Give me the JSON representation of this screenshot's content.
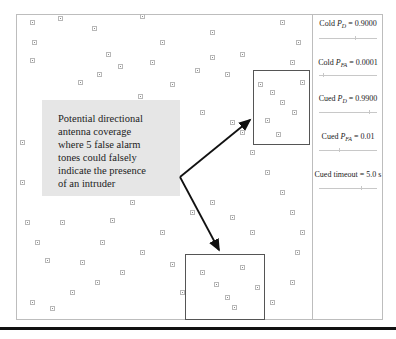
{
  "diagram": {
    "callout": {
      "lines": [
        "Potential directional",
        "antenna coverage",
        "where 5 false alarm",
        "tones could falsely",
        "indicate the presence",
        "of an intruder"
      ]
    },
    "zones": [
      {
        "name": "upper-coverage-zone",
        "x": 253,
        "y": 70,
        "w": 57,
        "h": 75
      },
      {
        "name": "lower-coverage-zone",
        "x": 185,
        "y": 254,
        "w": 80,
        "h": 66
      }
    ],
    "arrows": [
      {
        "name": "arrow-to-upper-zone",
        "from": [
          180,
          177
        ],
        "to": [
          253,
          118
        ]
      },
      {
        "name": "arrow-to-lower-zone",
        "from": [
          180,
          177
        ],
        "to": [
          220,
          254
        ]
      }
    ]
  },
  "panel": {
    "params": [
      {
        "prefix": "Cold ",
        "symbol": "P",
        "subscript": "D",
        "value": " = 0.9000"
      },
      {
        "prefix": "Cold ",
        "symbol": "P",
        "subscript": "FA",
        "value": " = 0.0001"
      },
      {
        "prefix": "Cued ",
        "symbol": "P",
        "subscript": "D",
        "value": " = 0.9900"
      },
      {
        "prefix": "Cued ",
        "symbol": "P",
        "subscript": "FA",
        "value": " = 0.01"
      },
      {
        "prefix": "Cued timeout",
        "symbol": "",
        "subscript": "",
        "value": " = 5.0 s"
      }
    ]
  },
  "colors": {
    "callout_bg": "#e6e6e6",
    "marker": "#b8b8b8",
    "zone_border": "#555555",
    "arrow": "#111111"
  }
}
